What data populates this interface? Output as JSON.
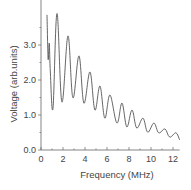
{
  "chart_data": {
    "type": "line",
    "title": "",
    "xlabel": "Frequency (MHz)",
    "ylabel": "Voltage (arb.units)",
    "xlim": [
      0,
      12.6
    ],
    "ylim": [
      0,
      4.2
    ],
    "xticks": [
      0,
      2,
      4,
      6,
      8,
      10,
      12
    ],
    "xtick_labels": [
      "0",
      "2",
      "4",
      "6",
      "8",
      "10",
      "12"
    ],
    "yticks": [
      0.0,
      1.0,
      2.0,
      3.0
    ],
    "ytick_labels": [
      "0.0",
      "1.0",
      "2.0",
      "3.0"
    ],
    "grid": false,
    "legend": null,
    "series": [
      {
        "name": "Voltage",
        "color": "#555555",
        "x": [
          0.55,
          0.65,
          0.75,
          0.85,
          1.09,
          1.45,
          1.9,
          2.45,
          2.9,
          3.45,
          3.9,
          4.45,
          4.9,
          5.36,
          5.8,
          6.27,
          6.9,
          7.36,
          7.8,
          8.27,
          8.7,
          9.27,
          9.7,
          10.27,
          10.7,
          11.27,
          11.7,
          12.27,
          12.6
        ],
        "y": [
          3.86,
          2.6,
          3.05,
          2.2,
          1.2,
          3.9,
          1.37,
          3.26,
          1.49,
          2.69,
          1.34,
          2.23,
          1.14,
          1.83,
          0.91,
          1.57,
          0.77,
          1.34,
          0.66,
          1.14,
          0.63,
          0.91,
          0.51,
          0.77,
          0.49,
          0.6,
          0.37,
          0.49,
          0.29
        ]
      }
    ]
  },
  "axes": {
    "x_label": "Frequency (MHz)",
    "y_label": "Voltage (arb.units)"
  }
}
